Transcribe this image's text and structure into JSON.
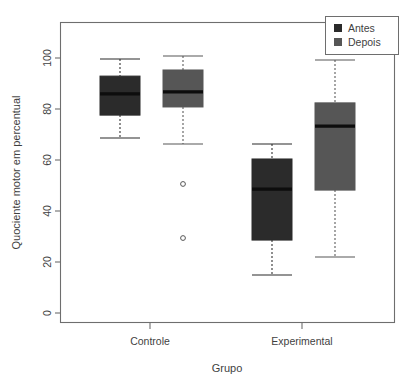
{
  "chart_data": {
    "type": "bar",
    "subtype": "boxplot",
    "title": "",
    "xlabel": "Grupo",
    "ylabel": "Quociente motor em percentual",
    "categories": [
      "Controle",
      "Experimental"
    ],
    "ylim": [
      -6,
      112
    ],
    "yticks": [
      0,
      20,
      40,
      60,
      80,
      100
    ],
    "ytick_labels": [
      "0",
      "20",
      "40",
      "60",
      "80",
      "100"
    ],
    "grid": false,
    "legend": {
      "position": "top-right",
      "entries": [
        {
          "name": "Antes",
          "color": "#2b2b2b"
        },
        {
          "name": "Depois",
          "color": "#565656"
        }
      ]
    },
    "series": [
      {
        "name": "Antes",
        "color": "#2b2b2b",
        "boxes": [
          {
            "category": "Controle",
            "whisker_low": 68.6,
            "q1": 77.6,
            "median": 85.9,
            "q3": 92.9,
            "whisker_high": 99.6,
            "outliers": []
          },
          {
            "category": "Experimental",
            "whisker_low": 14.9,
            "q1": 28.6,
            "median": 48.6,
            "q3": 60.4,
            "whisker_high": 66.3,
            "outliers": []
          }
        ]
      },
      {
        "name": "Depois",
        "color": "#565656",
        "boxes": [
          {
            "category": "Controle",
            "whisker_low": 66.3,
            "q1": 80.8,
            "median": 86.7,
            "q3": 95.3,
            "whisker_high": 100.8,
            "outliers": [
              50.6,
              29.4
            ]
          },
          {
            "category": "Experimental",
            "whisker_low": 22.0,
            "q1": 48.2,
            "median": 73.3,
            "q3": 82.4,
            "whisker_high": 99.2,
            "outliers": []
          }
        ]
      }
    ]
  },
  "axes": {
    "y_title": "Quociente motor em percentual",
    "x_title": "Grupo",
    "y_tick_0": "0",
    "y_tick_1": "20",
    "y_tick_2": "40",
    "y_tick_3": "60",
    "y_tick_4": "80",
    "y_tick_5": "100",
    "x_cat_0": "Controle",
    "x_cat_1": "Experimental"
  },
  "legend": {
    "entry_0": "Antes",
    "entry_1": "Depois"
  }
}
